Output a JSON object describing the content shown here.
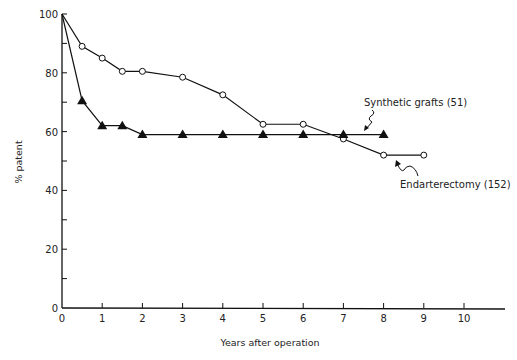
{
  "chart_data": {
    "type": "line",
    "title": "",
    "xlabel": "Years after operation",
    "ylabel": "% patent",
    "xlim": [
      0,
      11
    ],
    "ylim": [
      0,
      100
    ],
    "x_ticks": [
      0,
      1,
      2,
      3,
      4,
      5,
      6,
      7,
      8,
      9,
      10
    ],
    "x_tick_labels": [
      "0",
      "1",
      "2",
      "3",
      "4",
      "5",
      "6",
      "7",
      "8",
      "9",
      "10"
    ],
    "y_ticks_minor": [
      10,
      30,
      50,
      70,
      90
    ],
    "y_ticks": [
      0,
      20,
      40,
      60,
      80,
      100
    ],
    "y_tick_labels": [
      "0",
      "20",
      "40",
      "60",
      "80",
      "100"
    ],
    "grid": false,
    "legend": "none (direct annotations)",
    "series": [
      {
        "name": "Endarterectomy (152)",
        "marker": "open-circle",
        "x": [
          0,
          0.5,
          1,
          1.5,
          2,
          3,
          4,
          5,
          6,
          7,
          8,
          9
        ],
        "values": [
          100,
          89,
          85,
          80.5,
          80.5,
          78.5,
          72.5,
          62.5,
          62.5,
          57.5,
          52,
          52
        ]
      },
      {
        "name": "Synthetic grafts (51)",
        "marker": "filled-triangle",
        "x": [
          0,
          0.5,
          1,
          1.5,
          2,
          3,
          4,
          5,
          6,
          7,
          8
        ],
        "values": [
          100,
          70.5,
          62,
          62,
          59,
          59,
          59,
          59,
          59,
          59,
          59
        ]
      }
    ],
    "annotations": [
      {
        "text": "Synthetic grafts (51)",
        "x": 7.6,
        "y": 66.5,
        "points_to": "Synthetic grafts"
      },
      {
        "text": "Endarterectomy (152)",
        "x": 7.8,
        "y": 39.5,
        "points_to": "Endarterectomy"
      }
    ]
  }
}
